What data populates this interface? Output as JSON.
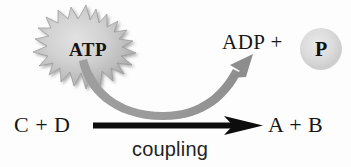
{
  "diagram": {
    "background_color": "#fdfdfd",
    "energy_source": {
      "label": "ATP",
      "shape": "starburst",
      "fill_color": "#c9c9c9",
      "stroke_color": "#9a9a9a",
      "text_color": "#141414"
    },
    "products_of_hydrolysis": {
      "label": "ADP  +",
      "phosphate_label": "P",
      "phosphate_shape": "circle",
      "phosphate_fill": "#dcdcdc",
      "text_color": "#171717"
    },
    "reaction": {
      "reactants": "C  +  D",
      "products": "A  +  B",
      "arrow_label": "coupling",
      "arrow_color": "#0d0d0d",
      "arrow_direction": "left-to-right",
      "text_color": "#151515"
    },
    "coupling_arrow": {
      "color": "#9b9b9b",
      "description": "curved arrow from ATP down across reaction arrow and up to ADP + P",
      "direction": "up-right"
    }
  }
}
